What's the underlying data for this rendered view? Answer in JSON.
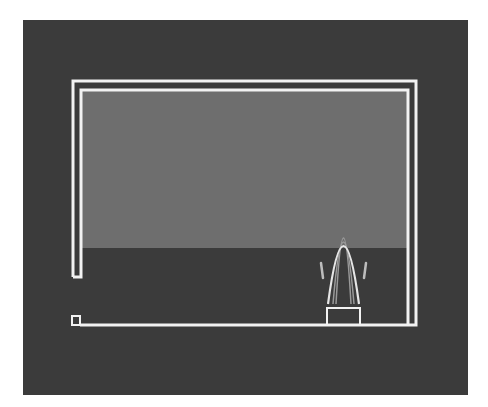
{
  "canvas": {
    "width": 488,
    "height": 407,
    "background": "#ffffff"
  },
  "colors": {
    "panel": "#3b3b3b",
    "upper_fill": "#6e6e6e",
    "line": "#f2f2f2",
    "arch_bright": "#e6e6e6",
    "arch_faint": "#9a9a9a",
    "tick": "#bdbdbd"
  },
  "panel": {
    "x": 23,
    "y": 20,
    "w": 445,
    "h": 375
  },
  "upper_region": {
    "x": 82,
    "y": 91,
    "w": 325,
    "h": 157
  },
  "outer_frame": {
    "top_y": 81,
    "left_x": 73,
    "right_x": 416,
    "left_bottom_y": 277,
    "bottom_y": 325,
    "stroke": 3
  },
  "inner_frame": {
    "top_y": 90,
    "left_x": 81,
    "right_x": 408,
    "left_bottom_y": 277,
    "bottom_y": 325,
    "stroke": 3
  },
  "small_square": {
    "x": 72,
    "y": 316,
    "w": 8,
    "h": 9
  },
  "base_box": {
    "x": 327,
    "y": 308,
    "w": 33,
    "h": 17
  },
  "arch": {
    "left_x": 328,
    "right_x": 359,
    "base_y": 304,
    "peak_y_bright": 246,
    "peak_y_faint_1": 242,
    "peak_y_faint_2": 238
  },
  "side_ticks": [
    {
      "x1": 321,
      "y1": 263,
      "x2": 323,
      "y2": 278
    },
    {
      "x1": 366,
      "y1": 263,
      "x2": 364,
      "y2": 278
    }
  ]
}
